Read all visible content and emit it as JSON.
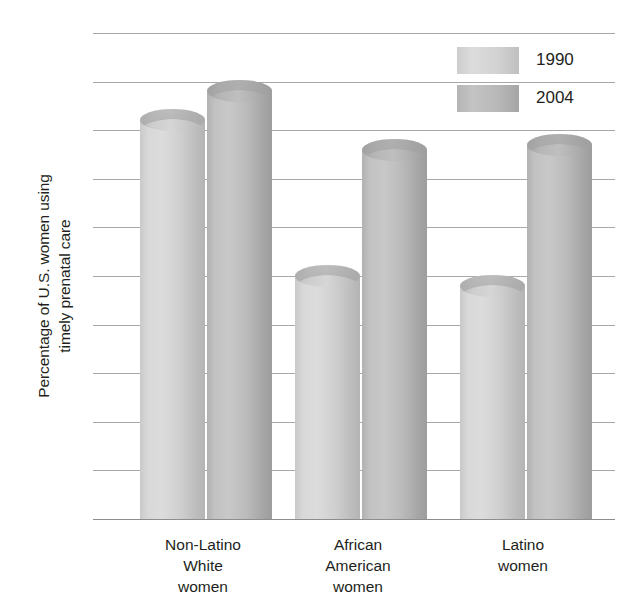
{
  "chart_data": {
    "type": "bar",
    "title": "",
    "subtitle": "",
    "xlabel": "",
    "ylabel": "Percentage of U.S. women using timely prenatal care",
    "ylabel_lines": [
      "Percentage of U.S. women using",
      "timely prenatal care"
    ],
    "categories": [
      "Non-Latino White women",
      "African American women",
      "Latino women"
    ],
    "category_lines": [
      [
        "Non-Latino",
        "White",
        "women"
      ],
      [
        "African",
        "American",
        "women"
      ],
      [
        "Latino",
        "women"
      ]
    ],
    "series": [
      {
        "name": "1990",
        "values": [
          82,
          50,
          48
        ],
        "color": "#d4d4d4"
      },
      {
        "name": "2004",
        "values": [
          88,
          76,
          77
        ],
        "color": "#b8b8b8"
      }
    ],
    "ylim": [
      0,
      100
    ],
    "ytick_step": 10,
    "yticks": [
      100,
      90,
      80,
      70,
      60,
      50,
      40,
      30,
      20,
      10,
      0
    ],
    "grid": true,
    "grid_color": "#a8a8a8",
    "legend_position": "top-right",
    "bar_style": "3d-cylinder",
    "background_color": "#ffffff",
    "text_color": "#231f20"
  }
}
